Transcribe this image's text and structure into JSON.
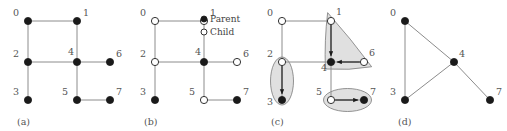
{
  "figure": {
    "panel_count": 4,
    "colors": {
      "edge": "#8c8c8c",
      "node_fill": "#1a1a1a",
      "node_stroke": "#333333",
      "node_hollow_fill": "#ffffff",
      "label": "#555555",
      "region_fill": "#e0e0e0",
      "region_stroke": "#7a7a7a",
      "arrow": "#1a1a1a",
      "background": "#ffffff"
    },
    "node_radius": 3.6,
    "panels": [
      {
        "id": "a",
        "caption": "(a)",
        "nodes": [
          {
            "id": "0",
            "label": "0",
            "x": 28,
            "y": 21,
            "state": "plain",
            "label_dx": -9,
            "label_dy": -5
          },
          {
            "id": "1",
            "label": "1",
            "x": 77,
            "y": 21,
            "state": "plain",
            "label_dx": 6,
            "label_dy": -5
          },
          {
            "id": "2",
            "label": "2",
            "x": 28,
            "y": 62,
            "state": "plain",
            "label_dx": -9,
            "label_dy": -5
          },
          {
            "id": "4",
            "label": "4",
            "x": 77,
            "y": 62,
            "state": "plain",
            "label_dx": -3,
            "label_dy": -7
          },
          {
            "id": "6",
            "label": "6",
            "x": 110,
            "y": 62,
            "state": "plain",
            "label_dx": 6,
            "label_dy": -5
          },
          {
            "id": "3",
            "label": "3",
            "x": 28,
            "y": 100,
            "state": "plain",
            "label_dx": -9,
            "label_dy": -5
          },
          {
            "id": "5",
            "label": "5",
            "x": 77,
            "y": 100,
            "state": "plain",
            "label_dx": -9,
            "label_dy": -5
          },
          {
            "id": "7",
            "label": "7",
            "x": 110,
            "y": 100,
            "state": "plain",
            "label_dx": 6,
            "label_dy": -5
          }
        ],
        "edges": [
          {
            "from": "0",
            "to": "1"
          },
          {
            "from": "0",
            "to": "2"
          },
          {
            "from": "1",
            "to": "4"
          },
          {
            "from": "2",
            "to": "4"
          },
          {
            "from": "2",
            "to": "3"
          },
          {
            "from": "4",
            "to": "6"
          },
          {
            "from": "4",
            "to": "5"
          },
          {
            "from": "5",
            "to": "7"
          }
        ],
        "regions": [],
        "arrows": [],
        "legend": null
      },
      {
        "id": "b",
        "caption": "(b)",
        "nodes": [
          {
            "id": "0",
            "label": "0",
            "x": 28,
            "y": 21,
            "state": "child",
            "label_dx": -9,
            "label_dy": -5
          },
          {
            "id": "1",
            "label": "1",
            "x": 77,
            "y": 21,
            "state": "child",
            "label_dx": 6,
            "label_dy": -5
          },
          {
            "id": "2",
            "label": "2",
            "x": 28,
            "y": 62,
            "state": "child",
            "label_dx": -9,
            "label_dy": -5
          },
          {
            "id": "4",
            "label": "4",
            "x": 77,
            "y": 62,
            "state": "parent",
            "label_dx": -3,
            "label_dy": -7
          },
          {
            "id": "6",
            "label": "6",
            "x": 110,
            "y": 62,
            "state": "child",
            "label_dx": 6,
            "label_dy": -5
          },
          {
            "id": "3",
            "label": "3",
            "x": 28,
            "y": 100,
            "state": "parent",
            "label_dx": -9,
            "label_dy": -5
          },
          {
            "id": "5",
            "label": "5",
            "x": 77,
            "y": 100,
            "state": "child",
            "label_dx": -9,
            "label_dy": -5
          },
          {
            "id": "7",
            "label": "7",
            "x": 110,
            "y": 100,
            "state": "parent",
            "label_dx": 6,
            "label_dy": -5
          }
        ],
        "edges": [
          {
            "from": "0",
            "to": "1"
          },
          {
            "from": "0",
            "to": "2"
          },
          {
            "from": "1",
            "to": "4"
          },
          {
            "from": "2",
            "to": "4"
          },
          {
            "from": "2",
            "to": "3"
          },
          {
            "from": "4",
            "to": "6"
          },
          {
            "from": "4",
            "to": "5"
          },
          {
            "from": "5",
            "to": "7"
          }
        ],
        "regions": [],
        "arrows": [],
        "legend": {
          "x": 74,
          "y": 22,
          "items": [
            {
              "marker": "filled-dot-icon",
              "label": "Parent"
            },
            {
              "marker": "hollow-dot-icon",
              "label": "Child"
            }
          ]
        }
      },
      {
        "id": "c",
        "caption": "(c)",
        "nodes": [
          {
            "id": "0",
            "label": "0",
            "x": 28,
            "y": 21,
            "state": "child",
            "label_dx": -9,
            "label_dy": -5
          },
          {
            "id": "1",
            "label": "1",
            "x": 77,
            "y": 21,
            "state": "child",
            "label_dx": 5,
            "label_dy": -6
          },
          {
            "id": "2",
            "label": "2",
            "x": 28,
            "y": 62,
            "state": "child",
            "label_dx": -9,
            "label_dy": -5
          },
          {
            "id": "4",
            "label": "4",
            "x": 77,
            "y": 62,
            "state": "parent",
            "label_dx": -4,
            "label_dy": 9
          },
          {
            "id": "6",
            "label": "6",
            "x": 110,
            "y": 62,
            "state": "child",
            "label_dx": 5,
            "label_dy": -6
          },
          {
            "id": "3",
            "label": "3",
            "x": 28,
            "y": 100,
            "state": "parent",
            "label_dx": -9,
            "label_dy": 5
          },
          {
            "id": "5",
            "label": "5",
            "x": 77,
            "y": 100,
            "state": "child",
            "label_dx": -9,
            "label_dy": -5
          },
          {
            "id": "7",
            "label": "7",
            "x": 110,
            "y": 100,
            "state": "parent",
            "label_dx": 6,
            "label_dy": -5
          }
        ],
        "edges": [
          {
            "from": "0",
            "to": "1"
          },
          {
            "from": "0",
            "to": "2"
          },
          {
            "from": "1",
            "to": "4"
          },
          {
            "from": "2",
            "to": "4"
          },
          {
            "from": "2",
            "to": "3"
          },
          {
            "from": "4",
            "to": "6"
          },
          {
            "from": "4",
            "to": "5"
          },
          {
            "from": "5",
            "to": "7"
          }
        ],
        "regions": [
          {
            "name": "cluster-2-3",
            "shape": "ellipse",
            "cx": 28,
            "cy": 81,
            "rx": 11.5,
            "ry": 24,
            "rotation": 0,
            "members": [
              "2",
              "3"
            ]
          },
          {
            "name": "cluster-1-6-4",
            "shape": "triangle",
            "members": [
              "1",
              "6",
              "4"
            ]
          },
          {
            "name": "cluster-5-7",
            "shape": "ellipse",
            "cx": 93.5,
            "cy": 100,
            "rx": 24,
            "ry": 11.5,
            "rotation": 0,
            "members": [
              "5",
              "7"
            ]
          }
        ],
        "arrows": [
          {
            "from": "1",
            "to": "4",
            "name": "arrow-1-to-4"
          },
          {
            "from": "6",
            "to": "4",
            "name": "arrow-6-to-4"
          },
          {
            "from": "2",
            "to": "3",
            "name": "arrow-2-to-3"
          },
          {
            "from": "5",
            "to": "7",
            "name": "arrow-5-to-7"
          }
        ],
        "legend": null
      },
      {
        "id": "d",
        "caption": "(d)",
        "nodes": [
          {
            "id": "0",
            "label": "0",
            "x": 24,
            "y": 21,
            "state": "plain",
            "label_dx": -9,
            "label_dy": -5
          },
          {
            "id": "4",
            "label": "4",
            "x": 73,
            "y": 62,
            "state": "plain",
            "label_dx": 5,
            "label_dy": -5
          },
          {
            "id": "3",
            "label": "3",
            "x": 24,
            "y": 100,
            "state": "plain",
            "label_dx": -9,
            "label_dy": -5
          },
          {
            "id": "7",
            "label": "7",
            "x": 109,
            "y": 100,
            "state": "plain",
            "label_dx": 6,
            "label_dy": -5
          }
        ],
        "edges": [
          {
            "from": "0",
            "to": "4"
          },
          {
            "from": "0",
            "to": "3"
          },
          {
            "from": "3",
            "to": "4"
          },
          {
            "from": "4",
            "to": "7"
          }
        ],
        "regions": [],
        "arrows": [],
        "legend": null
      }
    ]
  }
}
